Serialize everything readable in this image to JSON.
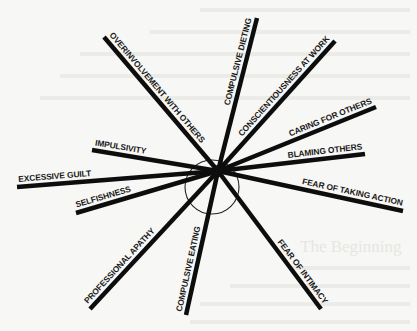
{
  "diagram": {
    "type": "radial-spoke-diagram",
    "hub": {
      "x": 218,
      "y": 171
    },
    "circle": {
      "cx": 212,
      "cy": 187,
      "r": 27
    },
    "spokes": [
      {
        "label": "OVERINVOLVEMENT WITH OTHERS",
        "end": [
          104,
          37
        ]
      },
      {
        "label": "COMPULSIVE DIETING",
        "end": [
          257,
          18
        ]
      },
      {
        "label": "CONSCIENTIOUSNESS AT WORK",
        "end": [
          335,
          41
        ]
      },
      {
        "label": "CARING FOR OTHERS",
        "end": [
          376,
          107
        ]
      },
      {
        "label": "BLAMING OTHERS",
        "end": [
          365,
          154
        ]
      },
      {
        "label": "FEAR OF TAKING ACTION",
        "end": [
          403,
          211
        ]
      },
      {
        "label": "FEAR OF INTIMACY",
        "end": [
          321,
          309
        ]
      },
      {
        "label": "COMPULSIVE EATING",
        "end": [
          186,
          315
        ]
      },
      {
        "label": "PROFESSIONAL APATHY",
        "end": [
          90,
          309
        ]
      },
      {
        "label": "SELFISHNESS",
        "end": [
          76,
          213
        ]
      },
      {
        "label": "EXCESSIVE GUILT",
        "end": [
          17,
          187
        ]
      },
      {
        "label": "IMPULSIVITY",
        "end": [
          92,
          150
        ]
      }
    ],
    "background_text": "The Beginning"
  }
}
